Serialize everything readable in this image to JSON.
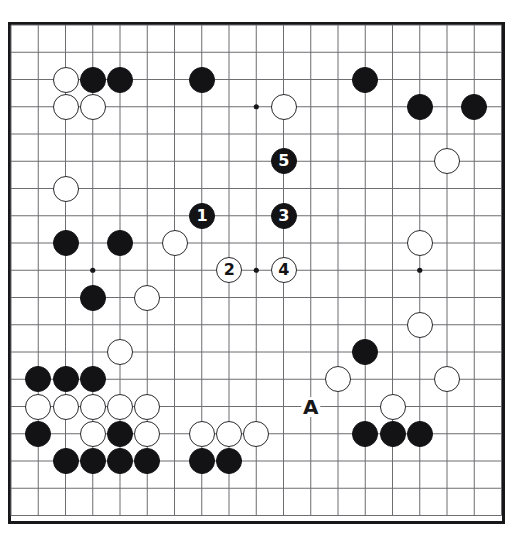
{
  "diagram": {
    "type": "go-board-diagram",
    "board_size": 19,
    "geometry": {
      "origin_x": 11,
      "origin_y": 25,
      "cell": 27.25,
      "stone_diameter": 26,
      "border_left": 8,
      "border_top": 22,
      "border_width": 497,
      "border_height": 502
    },
    "colors": {
      "board_background": "#ffffff",
      "line": "#6d6d72",
      "border": "#17171a",
      "black_stone": "#131316",
      "white_stone": "#ffffff",
      "white_stone_edge": "#2a2a2e",
      "label_text": "#17171a"
    },
    "star_points": [
      {
        "col": 3,
        "row": 3
      },
      {
        "col": 9,
        "row": 3
      },
      {
        "col": 15,
        "row": 3
      },
      {
        "col": 3,
        "row": 9
      },
      {
        "col": 9,
        "row": 9
      },
      {
        "col": 15,
        "row": 9
      },
      {
        "col": 3,
        "row": 15
      },
      {
        "col": 9,
        "row": 15
      },
      {
        "col": 15,
        "row": 15
      }
    ],
    "stones": [
      {
        "col": 2,
        "row": 2,
        "color": "white",
        "label": ""
      },
      {
        "col": 3,
        "row": 2,
        "color": "black",
        "label": ""
      },
      {
        "col": 4,
        "row": 2,
        "color": "black",
        "label": ""
      },
      {
        "col": 7,
        "row": 2,
        "color": "black",
        "label": ""
      },
      {
        "col": 13,
        "row": 2,
        "color": "black",
        "label": ""
      },
      {
        "col": 2,
        "row": 3,
        "color": "white",
        "label": ""
      },
      {
        "col": 3,
        "row": 3,
        "color": "white",
        "label": ""
      },
      {
        "col": 10,
        "row": 3,
        "color": "white",
        "label": ""
      },
      {
        "col": 15,
        "row": 3,
        "color": "black",
        "label": ""
      },
      {
        "col": 17,
        "row": 3,
        "color": "black",
        "label": ""
      },
      {
        "col": 10,
        "row": 5,
        "color": "black",
        "label": "5"
      },
      {
        "col": 16,
        "row": 5,
        "color": "white",
        "label": ""
      },
      {
        "col": 2,
        "row": 6,
        "color": "white",
        "label": ""
      },
      {
        "col": 7,
        "row": 7,
        "color": "black",
        "label": "1"
      },
      {
        "col": 10,
        "row": 7,
        "color": "black",
        "label": "3"
      },
      {
        "col": 2,
        "row": 8,
        "color": "black",
        "label": ""
      },
      {
        "col": 4,
        "row": 8,
        "color": "black",
        "label": ""
      },
      {
        "col": 6,
        "row": 8,
        "color": "white",
        "label": ""
      },
      {
        "col": 15,
        "row": 8,
        "color": "white",
        "label": ""
      },
      {
        "col": 8,
        "row": 9,
        "color": "white",
        "label": "2"
      },
      {
        "col": 10,
        "row": 9,
        "color": "white",
        "label": "4"
      },
      {
        "col": 3,
        "row": 10,
        "color": "black",
        "label": ""
      },
      {
        "col": 5,
        "row": 10,
        "color": "white",
        "label": ""
      },
      {
        "col": 15,
        "row": 11,
        "color": "white",
        "label": ""
      },
      {
        "col": 4,
        "row": 12,
        "color": "white",
        "label": ""
      },
      {
        "col": 13,
        "row": 12,
        "color": "black",
        "label": ""
      },
      {
        "col": 1,
        "row": 13,
        "color": "black",
        "label": ""
      },
      {
        "col": 2,
        "row": 13,
        "color": "black",
        "label": ""
      },
      {
        "col": 3,
        "row": 13,
        "color": "black",
        "label": ""
      },
      {
        "col": 12,
        "row": 13,
        "color": "white",
        "label": ""
      },
      {
        "col": 16,
        "row": 13,
        "color": "white",
        "label": ""
      },
      {
        "col": 1,
        "row": 14,
        "color": "white",
        "label": ""
      },
      {
        "col": 2,
        "row": 14,
        "color": "white",
        "label": ""
      },
      {
        "col": 3,
        "row": 14,
        "color": "white",
        "label": ""
      },
      {
        "col": 4,
        "row": 14,
        "color": "white",
        "label": ""
      },
      {
        "col": 5,
        "row": 14,
        "color": "white",
        "label": ""
      },
      {
        "col": 14,
        "row": 14,
        "color": "white",
        "label": ""
      },
      {
        "col": 1,
        "row": 15,
        "color": "black",
        "label": ""
      },
      {
        "col": 3,
        "row": 15,
        "color": "white",
        "label": ""
      },
      {
        "col": 4,
        "row": 15,
        "color": "black",
        "label": ""
      },
      {
        "col": 5,
        "row": 15,
        "color": "white",
        "label": ""
      },
      {
        "col": 7,
        "row": 15,
        "color": "white",
        "label": ""
      },
      {
        "col": 8,
        "row": 15,
        "color": "white",
        "label": ""
      },
      {
        "col": 9,
        "row": 15,
        "color": "white",
        "label": ""
      },
      {
        "col": 13,
        "row": 15,
        "color": "black",
        "label": ""
      },
      {
        "col": 14,
        "row": 15,
        "color": "black",
        "label": ""
      },
      {
        "col": 15,
        "row": 15,
        "color": "black",
        "label": ""
      },
      {
        "col": 2,
        "row": 16,
        "color": "black",
        "label": ""
      },
      {
        "col": 3,
        "row": 16,
        "color": "black",
        "label": ""
      },
      {
        "col": 4,
        "row": 16,
        "color": "black",
        "label": ""
      },
      {
        "col": 5,
        "row": 16,
        "color": "black",
        "label": ""
      },
      {
        "col": 7,
        "row": 16,
        "color": "black",
        "label": ""
      },
      {
        "col": 8,
        "row": 16,
        "color": "black",
        "label": ""
      }
    ],
    "point_labels": [
      {
        "col": 11,
        "row": 14,
        "text": "A"
      }
    ],
    "move_sequence": [
      {
        "number": "1",
        "color": "black",
        "col": 7,
        "row": 7
      },
      {
        "number": "2",
        "color": "white",
        "col": 8,
        "row": 9
      },
      {
        "number": "3",
        "color": "black",
        "col": 10,
        "row": 7
      },
      {
        "number": "4",
        "color": "white",
        "col": 10,
        "row": 9
      },
      {
        "number": "5",
        "color": "black",
        "col": 10,
        "row": 5
      }
    ]
  }
}
